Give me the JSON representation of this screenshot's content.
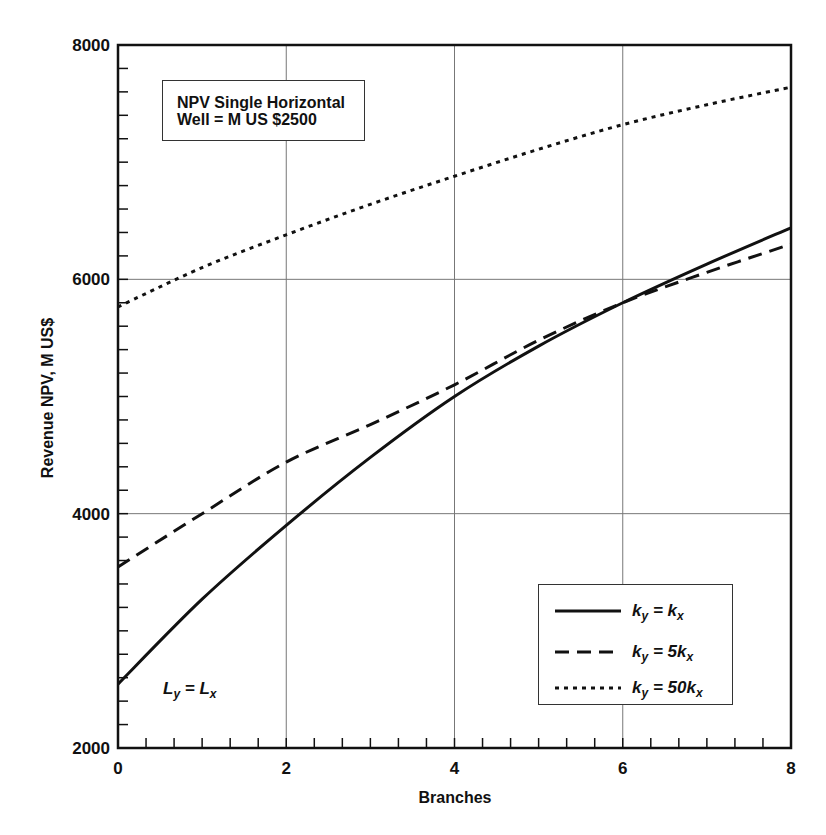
{
  "chart_data": {
    "type": "line",
    "title": "NPV Single Horizontal Well = M US $2500",
    "title_lines": [
      "NPV Single Horizontal",
      "Well = M US $2500"
    ],
    "xlabel": "Branches",
    "ylabel": "Revenue NPV, M US$",
    "xlim": [
      0,
      8
    ],
    "ylim": [
      2000,
      8000
    ],
    "x_ticks": [
      "0",
      "2",
      "4",
      "6",
      "8"
    ],
    "y_ticks": [
      "2000",
      "4000",
      "6000",
      "8000"
    ],
    "grid": true,
    "legend_position": "lower right",
    "annotation": "Ly = Lx",
    "x": [
      0,
      1,
      2,
      3,
      4,
      5,
      6,
      7,
      8
    ],
    "series": [
      {
        "name": "ky = kx",
        "style": "solid",
        "values": [
          2545,
          3270,
          3900,
          4480,
          5000,
          5430,
          5800,
          6130,
          6440
        ]
      },
      {
        "name": "ky = 5kx",
        "style": "dashed",
        "values": [
          3545,
          4000,
          4440,
          4760,
          5100,
          5480,
          5800,
          6060,
          6300
        ]
      },
      {
        "name": "ky = 50kx",
        "style": "dotted",
        "values": [
          5765,
          6100,
          6380,
          6640,
          6880,
          7110,
          7320,
          7490,
          7640
        ]
      }
    ]
  },
  "legend": {
    "items": [
      {
        "k": "k",
        "sub_y": "y",
        "eq": " = ",
        "coef": "",
        "sub_x": "x",
        "style": "solid"
      },
      {
        "k": "k",
        "sub_y": "y",
        "eq": " = ",
        "coef": "5",
        "sub_x": "x",
        "style": "dashed"
      },
      {
        "k": "k",
        "sub_y": "y",
        "eq": " = ",
        "coef": "50",
        "sub_x": "x",
        "style": "dotted"
      }
    ]
  },
  "annotation": {
    "L": "L",
    "sub_y": "y",
    "eq": " = ",
    "sub_x": "x"
  }
}
